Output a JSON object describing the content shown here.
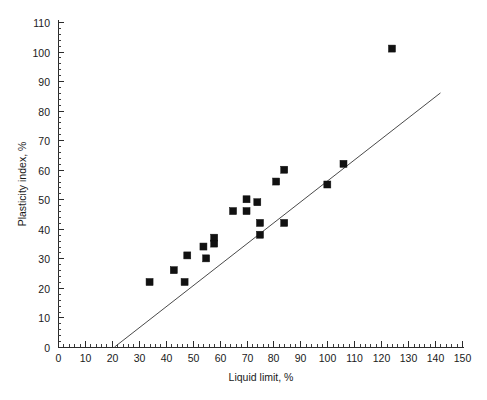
{
  "chart_data": {
    "type": "scatter",
    "title": "",
    "subtitle": "",
    "xlabel": "Liquid limit, %",
    "ylabel": "Plasticity index, %",
    "xlim": [
      0,
      150
    ],
    "ylim": [
      0,
      110
    ],
    "x_ticks": [
      0,
      10,
      20,
      30,
      40,
      50,
      60,
      70,
      80,
      90,
      100,
      110,
      120,
      130,
      140,
      150
    ],
    "y_ticks": [
      0,
      10,
      20,
      30,
      40,
      50,
      60,
      70,
      80,
      90,
      100,
      110
    ],
    "x_tick_labels": [
      "0",
      "10",
      "20",
      "30",
      "40",
      "50",
      "60",
      "70",
      "80",
      "90",
      "100",
      "110",
      "120",
      "130",
      "140",
      "150"
    ],
    "y_tick_labels": [
      "0",
      "10",
      "20",
      "30",
      "40",
      "50",
      "60",
      "70",
      "80",
      "90",
      "100",
      "110"
    ],
    "x_minor_interval": 2,
    "y_minor_interval": 2,
    "grid": false,
    "legend": false,
    "legend_position": "none",
    "marker_style": "filled-square",
    "marker_color": "#111111",
    "series": [
      {
        "name": "Soil samples",
        "points": [
          {
            "x": 34,
            "y": 22
          },
          {
            "x": 43,
            "y": 26
          },
          {
            "x": 47,
            "y": 22
          },
          {
            "x": 48,
            "y": 31
          },
          {
            "x": 54,
            "y": 34
          },
          {
            "x": 55,
            "y": 30
          },
          {
            "x": 58,
            "y": 37
          },
          {
            "x": 58,
            "y": 35
          },
          {
            "x": 65,
            "y": 46
          },
          {
            "x": 70,
            "y": 50
          },
          {
            "x": 70,
            "y": 46
          },
          {
            "x": 74,
            "y": 49
          },
          {
            "x": 75,
            "y": 42
          },
          {
            "x": 75,
            "y": 38
          },
          {
            "x": 81,
            "y": 56
          },
          {
            "x": 84,
            "y": 60
          },
          {
            "x": 84,
            "y": 42
          },
          {
            "x": 100,
            "y": 55
          },
          {
            "x": 106,
            "y": 62
          },
          {
            "x": 124,
            "y": 101
          }
        ]
      }
    ],
    "trend_line": {
      "name": "A-line",
      "x_start": 21,
      "y_start": 0,
      "x_end": 142,
      "y_end": 86,
      "slope": 0.711,
      "intercept": -14.9,
      "color": "#4a4a4a"
    }
  },
  "axes": {
    "x_axis_title": "Liquid limit, %",
    "y_axis_title": "Plasticity index, %"
  }
}
